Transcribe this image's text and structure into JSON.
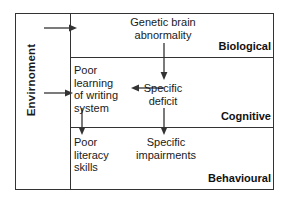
{
  "diagram": {
    "environment_label": "Envirnoment",
    "levels": [
      {
        "id": "biological",
        "label": "Biological"
      },
      {
        "id": "cognitive",
        "label": "Cognitive"
      },
      {
        "id": "behavioural",
        "label": "Behavioural"
      }
    ],
    "nodes": [
      {
        "id": "genetic-brain-abnormality",
        "text": "Genetic brain\nabnormality",
        "level": "biological"
      },
      {
        "id": "poor-learning-of-writing-system",
        "text": "Poor\nlearning\nof writing\nsystem",
        "level": "cognitive"
      },
      {
        "id": "specific-deficit",
        "text": "Specific\ndeficit",
        "level": "cognitive"
      },
      {
        "id": "poor-literacy-skills",
        "text": "Poor\nliteracy\nskills",
        "level": "behavioural"
      },
      {
        "id": "specific-impairments",
        "text": "Specific\nimpairments",
        "level": "behavioural"
      }
    ],
    "arrows": [
      {
        "id": "environment-to-biological",
        "from": "environment",
        "to": "biological-level",
        "direction": "right"
      },
      {
        "id": "environment-to-cognitive",
        "from": "environment",
        "to": "poor-learning",
        "direction": "right"
      },
      {
        "id": "genetic-to-specific-deficit",
        "from": "genetic-brain-abnormality",
        "to": "specific-deficit",
        "direction": "down"
      },
      {
        "id": "specific-deficit-to-poor-learning",
        "from": "specific-deficit",
        "to": "poor-learning-of-writing-system",
        "direction": "left"
      },
      {
        "id": "poor-learning-to-poor-literacy",
        "from": "poor-learning-of-writing-system",
        "to": "poor-literacy-skills",
        "direction": "down"
      },
      {
        "id": "specific-deficit-to-specific-impairments",
        "from": "specific-deficit",
        "to": "specific-impairments",
        "direction": "down"
      }
    ],
    "colors": {
      "border": "#333333",
      "text": "#1a1a1a",
      "background": "#ffffff"
    }
  }
}
